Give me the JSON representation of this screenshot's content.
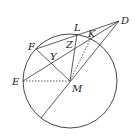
{
  "diagram": {
    "type": "geometry",
    "circle": {
      "center": "M",
      "cx": 70,
      "cy": 81,
      "r": 47
    },
    "points": {
      "D": {
        "x": 119,
        "y": 21,
        "label": "D"
      },
      "L": {
        "x": 77,
        "y": 34,
        "label": "L"
      },
      "K": {
        "x": 91,
        "y": 38,
        "label": "K"
      },
      "F": {
        "x": 36,
        "y": 49,
        "label": "F"
      },
      "Z": {
        "x": 70,
        "y": 46,
        "label": "Z"
      },
      "Y": {
        "x": 53,
        "y": 59,
        "label": "Y"
      },
      "E": {
        "x": 23,
        "y": 81,
        "label": "E"
      },
      "M": {
        "x": 70,
        "y": 81,
        "label": "M"
      },
      "P": {
        "x": 41,
        "y": 118,
        "label": ""
      }
    },
    "segments": [
      {
        "from": "D",
        "to": "F",
        "style": "solid"
      },
      {
        "from": "D",
        "to": "E",
        "style": "solid"
      },
      {
        "from": "D",
        "to": "P",
        "style": "solid"
      },
      {
        "from": "F",
        "to": "M",
        "style": "solid"
      },
      {
        "from": "L",
        "to": "M",
        "style": "solid"
      },
      {
        "from": "K",
        "to": "M",
        "style": "dotted"
      },
      {
        "from": "E",
        "to": "M",
        "style": "dotted"
      }
    ],
    "colors": {
      "stroke": "#333333",
      "label": "#222222"
    }
  }
}
